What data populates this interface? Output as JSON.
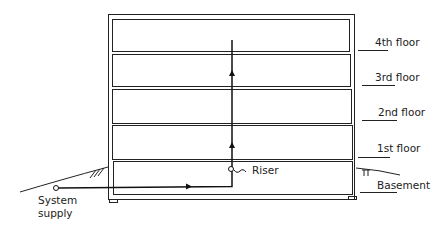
{
  "diagram": {
    "floors": [
      {
        "label": "4th floor"
      },
      {
        "label": "3rd floor"
      },
      {
        "label": "2nd floor"
      },
      {
        "label": "1st floor"
      },
      {
        "label": "Basement"
      }
    ],
    "riser_label": "Riser",
    "supply_label_1": "System",
    "supply_label_2": "supply",
    "colors": {
      "line": "#222222",
      "background": "#ffffff"
    }
  }
}
